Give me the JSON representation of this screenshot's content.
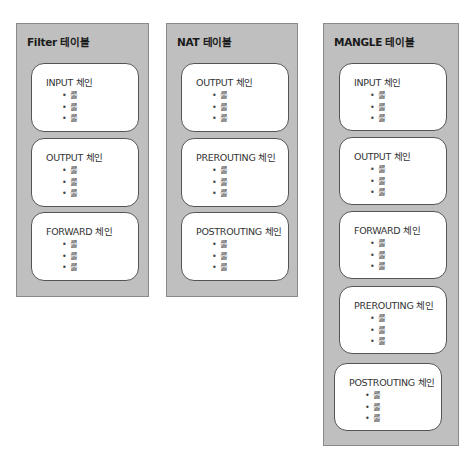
{
  "tables": [
    {
      "title": "Filter 테이블",
      "chains": [
        {
          "name": "INPUT 체인",
          "rules": [
            "룰",
            "룰",
            "룰"
          ]
        },
        {
          "name": "OUTPUT 체인",
          "rules": [
            "룰",
            "룰",
            "룰"
          ]
        },
        {
          "name": "FORWARD 체인",
          "rules": [
            "룰",
            "룰",
            "룰"
          ]
        }
      ]
    },
    {
      "title": "NAT 테이블",
      "chains": [
        {
          "name": "OUTPUT 체인",
          "rules": [
            "룰",
            "룰",
            "룰"
          ]
        },
        {
          "name": "PREROUTING 체인",
          "rules": [
            "룰",
            "룰",
            "룰"
          ]
        },
        {
          "name": "POSTROUTING 체인",
          "rules": [
            "룰",
            "룰",
            "룰"
          ]
        }
      ]
    },
    {
      "title": "MANGLE 테이블",
      "chains": [
        {
          "name": "INPUT 체인",
          "rules": [
            "룰",
            "룰",
            "룰"
          ]
        },
        {
          "name": "OUTPUT 체인",
          "rules": [
            "룰",
            "룰",
            "룰"
          ]
        },
        {
          "name": "FORWARD 체인",
          "rules": [
            "룰",
            "룰",
            "룰"
          ]
        },
        {
          "name": "PREROUTING 체인",
          "rules": [
            "룰",
            "룰",
            "룰"
          ]
        },
        {
          "name": "POSTROUTING 체인",
          "rules": [
            "룰",
            "룰",
            "룰"
          ]
        }
      ]
    }
  ],
  "bullet": "•"
}
